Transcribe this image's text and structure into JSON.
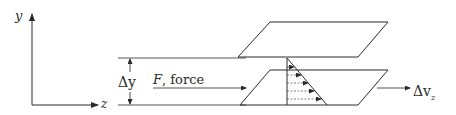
{
  "diagram": {
    "axes": {
      "vertical_label": "y",
      "horizontal_label": "z"
    },
    "labels": {
      "gap": "Δy",
      "force_symbol": "F",
      "force_text": ", force",
      "velocity_diff_main": "Δv",
      "velocity_diff_sub": "z"
    },
    "colors": {
      "line": "#2a2a2a",
      "background": "#ffffff"
    },
    "velocity_profile": {
      "arrow_count": 5,
      "shape": "linear"
    }
  }
}
